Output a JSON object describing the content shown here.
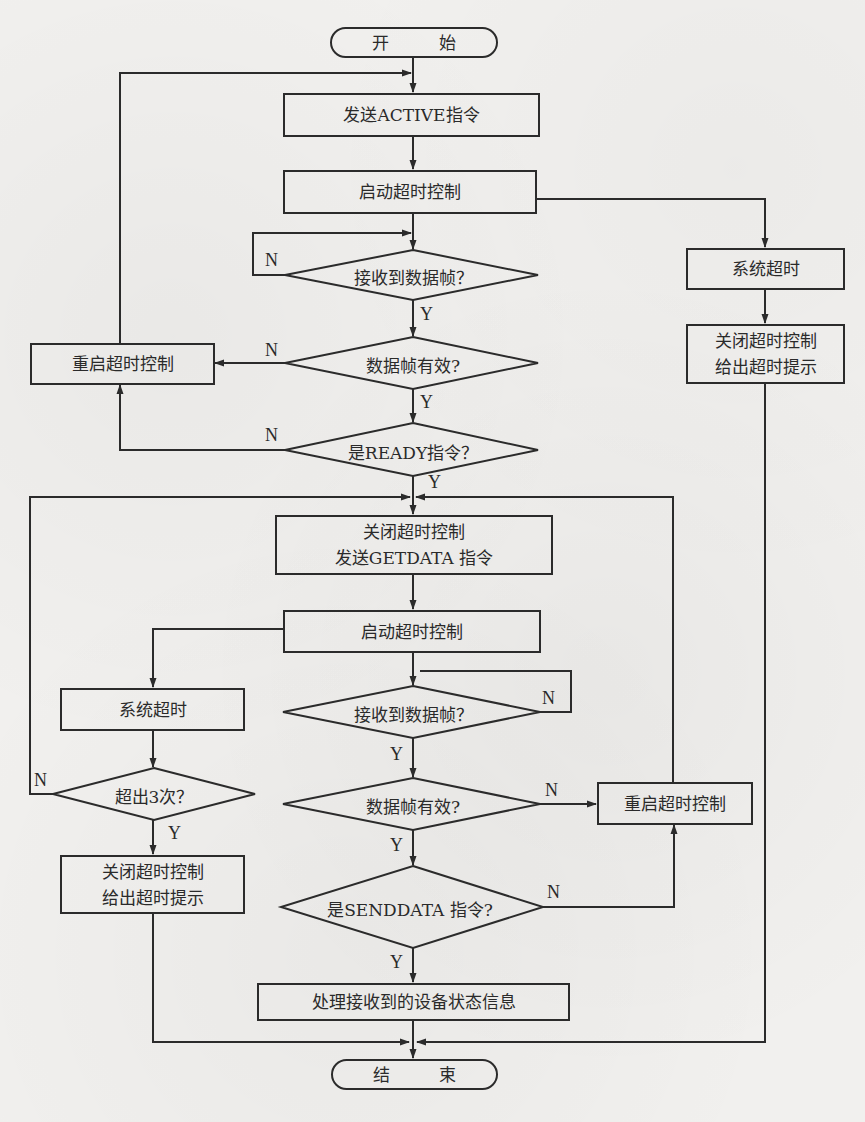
{
  "diagram": {
    "type": "flowchart",
    "terminals": {
      "start": "开 始",
      "end": "结 束"
    },
    "process": {
      "send_active": "发送ACTIVE指令",
      "start_timeout_1": "启动超时控制",
      "restart_timeout_1": "重启超时控制",
      "system_timeout_1": "系统超时",
      "close_timeout_1_line1": "关闭超时控制",
      "close_timeout_1_line2": "给出超时提示",
      "close_send_getdata_line1": "关闭超时控制",
      "close_send_getdata_line2": "发送GETDATA 指令",
      "start_timeout_2": "启动超时控制",
      "system_timeout_2": "系统超时",
      "close_timeout_2_line1": "关闭超时控制",
      "close_timeout_2_line2": "给出超时提示",
      "restart_timeout_2": "重启超时控制",
      "process_status": "处理接收到的设备状态信息"
    },
    "decisions": {
      "recv_frame_1": "接收到数据帧？",
      "frame_valid_1": "数据帧有效?",
      "is_ready": "是READY指令？",
      "recv_frame_2": "接收到数据帧？",
      "exceed_3": "超出3次？",
      "frame_valid_2": "数据帧有效?",
      "is_senddata": "是SENDDATA 指令?"
    },
    "labels": {
      "yes": "Y",
      "no": "N"
    }
  }
}
